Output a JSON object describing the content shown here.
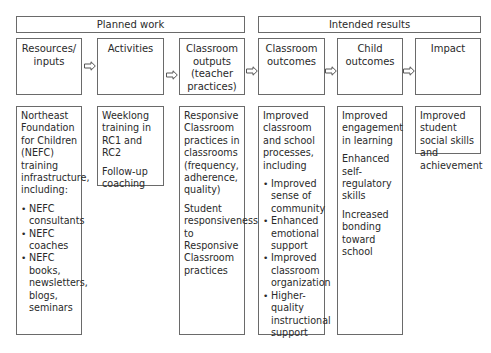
{
  "groups": {
    "planned_work": "Planned work",
    "intended_results": "Intended results"
  },
  "columns": [
    {
      "header": "Resources/ inputs"
    },
    {
      "header": "Activities"
    },
    {
      "header": "Classroom outputs (teacher practices)"
    },
    {
      "header": "Classroom outcomes"
    },
    {
      "header": "Child outcomes"
    },
    {
      "header": "Impact"
    }
  ],
  "details": {
    "resources": {
      "intro": "Northeast Foundation for Children (NEFC) training infrastructure, including:",
      "bullets": [
        "NEFC consultants",
        "NEFC coaches",
        "NEFC books, newsletters, blogs, seminars"
      ]
    },
    "activities": {
      "paragraphs": [
        "Weeklong training in RC1 and RC2",
        "Follow-up coaching"
      ]
    },
    "classroom_outputs": {
      "paragraphs": [
        "Responsive Classroom practices in classrooms (frequency, adherence, quality)",
        "Student responsiveness to Responsive Classroom practices"
      ]
    },
    "classroom_outcomes": {
      "intro": "Improved classroom and school processes, including",
      "bullets": [
        "Improved sense of community",
        "Enhanced emotional support",
        "Improved classroom organization",
        "Higher-quality instructional support"
      ]
    },
    "child_outcomes": {
      "paragraphs": [
        "Improved engagement in learning",
        "Enhanced self-regulatory skills",
        "Increased bonding toward school"
      ]
    },
    "impact": {
      "paragraphs": [
        "Improved student social skills and achievement"
      ]
    }
  },
  "arrow_icon": "hollow-right-arrow",
  "colors": {
    "border": "#6a6a6a",
    "text": "#2a2a2a"
  }
}
